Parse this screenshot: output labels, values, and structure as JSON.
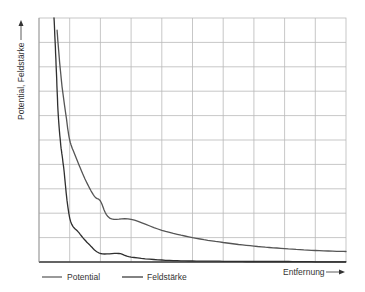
{
  "chart_data": {
    "type": "line",
    "title": "",
    "xlabel": "Entfernung",
    "ylabel": "Potential, Feldstärke",
    "xlim": [
      0,
      10
    ],
    "ylim": [
      0,
      10
    ],
    "grid": true,
    "x_ticks_count": 10,
    "y_ticks_count": 10,
    "tick_labels_shown": false,
    "legend_position": "bottom-left",
    "legend": [
      "Potential",
      "Feldstärke"
    ],
    "series": [
      {
        "name": "Potential",
        "color": "#555555",
        "x": [
          0.59,
          0.65,
          0.75,
          0.88,
          1.0,
          1.2,
          1.5,
          1.8,
          2.0,
          2.3,
          3.0,
          4.0,
          5.0,
          6.0,
          7.0,
          8.0,
          9.0,
          10.0
        ],
        "y": [
          9.5,
          8.5,
          7.2,
          6.0,
          5.0,
          4.3,
          3.4,
          2.7,
          2.5,
          1.8,
          1.75,
          1.3,
          1.0,
          0.8,
          0.65,
          0.55,
          0.47,
          0.43
        ]
      },
      {
        "name": "Feldstärke",
        "color": "#2f2f2f",
        "x": [
          0.49,
          0.55,
          0.62,
          0.7,
          0.8,
          1.0,
          1.3,
          1.65,
          2.0,
          2.6,
          3.0,
          4.0,
          5.0,
          6.0,
          7.0,
          8.0,
          9.0,
          10.0
        ],
        "y": [
          10.0,
          8.3,
          6.2,
          4.9,
          3.9,
          1.8,
          1.2,
          0.7,
          0.35,
          0.35,
          0.2,
          0.08,
          0.04,
          0.03,
          0.02,
          0.02,
          0.01,
          0.01
        ]
      }
    ]
  },
  "labels": {
    "y_axis": "Potential, Feldstärke",
    "x_axis": "Entfernung",
    "legend_potential": "Potential",
    "legend_feldstaerke": "Feldstärke"
  }
}
